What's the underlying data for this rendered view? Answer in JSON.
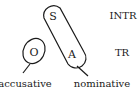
{
  "diagram": {
    "type": "alignment-diagram",
    "roles": {
      "S": "S",
      "A": "A",
      "O": "O"
    },
    "rows": {
      "intransitive": "INTR",
      "transitive": "TR"
    },
    "groups": [
      {
        "name": "accusative",
        "label": "accusative",
        "members": [
          "O"
        ]
      },
      {
        "name": "nominative",
        "label": "nominative",
        "members": [
          "S",
          "A"
        ]
      }
    ],
    "stroke_color": "#1a1a1a",
    "background": "#ffffff"
  }
}
